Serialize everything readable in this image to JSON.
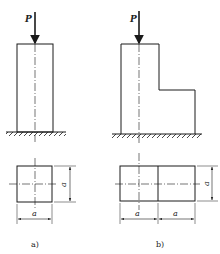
{
  "header_fragment": "图 (cut off)",
  "figures": [
    {
      "id": "a",
      "caption": "a)",
      "load_label": "P",
      "dims": {
        "height": "a",
        "width": "a"
      }
    },
    {
      "id": "b",
      "caption": "b)",
      "load_label": "P",
      "dims": {
        "height": "a",
        "width_left": "a",
        "width_right": "a"
      }
    }
  ],
  "colors": {
    "line": "#1a1a1a",
    "bg": "#ffffff"
  }
}
